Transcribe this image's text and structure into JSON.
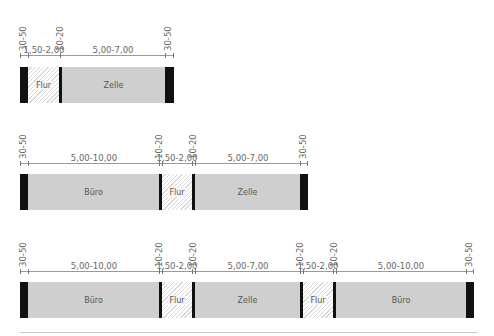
{
  "colors": {
    "wall": "#111111",
    "room": "#cfcfcf",
    "corridor_hatch": "#d8d8d8",
    "dimension": "#9a9a9a"
  },
  "rows": [
    {
      "id": "row1",
      "segments": [
        {
          "type": "wall",
          "dim": "30-50"
        },
        {
          "type": "corridor",
          "label": "Flur",
          "dim": "1,50-2,00"
        },
        {
          "type": "wall",
          "dim": "10-20"
        },
        {
          "type": "room",
          "label": "Zelle",
          "dim": "5,00-7,00"
        },
        {
          "type": "wall",
          "dim": "30-50"
        }
      ]
    },
    {
      "id": "row2",
      "segments": [
        {
          "type": "wall",
          "dim": "30-50"
        },
        {
          "type": "room",
          "label": "Büro",
          "dim": "5,00-10,00"
        },
        {
          "type": "wall",
          "dim": "10-20"
        },
        {
          "type": "corridor",
          "label": "Flur",
          "dim": "1,50-2,00"
        },
        {
          "type": "wall",
          "dim": "10-20"
        },
        {
          "type": "room",
          "label": "Zelle",
          "dim": "5,00-7,00"
        },
        {
          "type": "wall",
          "dim": "30-50"
        }
      ]
    },
    {
      "id": "row3",
      "segments": [
        {
          "type": "wall",
          "dim": "30-50"
        },
        {
          "type": "room",
          "label": "Büro",
          "dim": "5,00-10,00"
        },
        {
          "type": "wall",
          "dim": "10-20"
        },
        {
          "type": "corridor",
          "label": "Flur",
          "dim": "1,50-2,00"
        },
        {
          "type": "wall",
          "dim": "10-20"
        },
        {
          "type": "room",
          "label": "Zelle",
          "dim": "5,00-7,00"
        },
        {
          "type": "wall",
          "dim": "10-20"
        },
        {
          "type": "corridor",
          "label": "Flur",
          "dim": "1,50-2,00"
        },
        {
          "type": "wall",
          "dim": "10-20"
        },
        {
          "type": "room",
          "label": "Büro",
          "dim": "5,00-10,00"
        },
        {
          "type": "wall",
          "dim": "30-50"
        }
      ]
    }
  ]
}
